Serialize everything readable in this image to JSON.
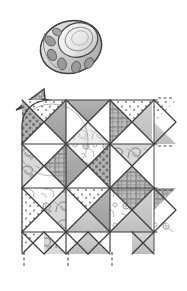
{
  "illustration": {
    "title": "Quilting block assembly diagram",
    "medium": "pencil-sketch-grayscale",
    "background_color": "#ffffff",
    "ink_color": "#3a3a3a"
  },
  "objects": [
    {
      "id": "thimble",
      "label": "Sewing thimble",
      "icon": "thimble-icon",
      "position": {
        "x": 40,
        "y": 16,
        "w": 62,
        "h": 62
      },
      "description": "Tilted metal thimble with dimpled band and smooth domed crown",
      "colors": {
        "body": "#cfcfcf",
        "crown": "#f2f2f2",
        "dimple": "#8f8f8f",
        "outline": "#3a3a3a"
      }
    },
    {
      "id": "pattern-triangle",
      "label": "Cut triangle pattern piece",
      "icon": "triangle-icon",
      "position": {
        "x": 14,
        "y": 87,
        "w": 32,
        "h": 28
      },
      "description": "Small dark gray triangle pointing left with dotted texture",
      "colors": {
        "fill": "#9a9a9a",
        "outline": "#3a3a3a"
      }
    },
    {
      "id": "quilt-grid",
      "label": "Hourglass quilt block grid",
      "position": {
        "x": 22,
        "y": 100,
        "w": 130,
        "h": 152
      },
      "rows": 3,
      "columns": 3,
      "block_size": 44,
      "description": "Three by three grid of quarter-square triangle hourglass blocks"
    }
  ],
  "fabric_patterns": [
    {
      "name": "polka-dot-gray",
      "base": "#b0b0b0",
      "dot": "#6f6f6f"
    },
    {
      "name": "polka-dot-white",
      "base": "#fdfdfd",
      "dot": "#8a8a8a"
    },
    {
      "name": "solid-medium-gray",
      "base": "#a8a8a8"
    },
    {
      "name": "solid-light-gray",
      "base": "#c8c8c8"
    },
    {
      "name": "plaid-gray",
      "base": "#b8b8b8",
      "line": "#6a6a6a"
    },
    {
      "name": "paisley-swirl",
      "base": "#d6d6d6",
      "line": "#7a7a7a"
    },
    {
      "name": "floral-sketch",
      "base": "#fbfbfb",
      "line": "#8a8a8a"
    },
    {
      "name": "solid-white",
      "base": "#ffffff"
    }
  ],
  "blocks": [
    {
      "row": 0,
      "col": 0,
      "top": "polka-dot-white",
      "right": "solid-medium-gray",
      "bottom": "solid-white",
      "left": "polka-dot-gray"
    },
    {
      "row": 0,
      "col": 1,
      "top": "solid-medium-gray",
      "right": "solid-white",
      "bottom": "paisley-swirl",
      "left": "solid-white"
    },
    {
      "row": 0,
      "col": 2,
      "top": "polka-dot-white",
      "right": "solid-light-gray",
      "bottom": "solid-white",
      "left": "plaid-gray"
    },
    {
      "row": 1,
      "col": 0,
      "top": "solid-white",
      "right": "plaid-gray",
      "bottom": "solid-white",
      "left": "paisley-swirl"
    },
    {
      "row": 1,
      "col": 1,
      "top": "floral-sketch",
      "right": "polka-dot-gray",
      "bottom": "solid-white",
      "left": "solid-medium-gray"
    },
    {
      "row": 1,
      "col": 2,
      "top": "paisley-swirl",
      "right": "solid-white",
      "bottom": "plaid-gray",
      "left": "solid-white"
    },
    {
      "row": 2,
      "col": 0,
      "top": "floral-sketch",
      "right": "paisley-swirl",
      "bottom": "solid-white",
      "left": "polka-dot-white"
    },
    {
      "row": 2,
      "col": 1,
      "top": "polka-dot-white",
      "right": "solid-medium-gray",
      "bottom": "solid-light-gray",
      "left": "solid-white"
    },
    {
      "row": 2,
      "col": 2,
      "top": "plaid-gray",
      "right": "solid-light-gray",
      "bottom": "solid-light-gray",
      "left": "floral-sketch"
    }
  ],
  "guides": {
    "label": "Dashed seam alignment tick marks",
    "bottom_ticks_x": [
      24,
      68,
      112
    ],
    "right_ticks_y": [
      104,
      152,
      200
    ],
    "style": "dashed",
    "color": "#4a4a4a"
  }
}
